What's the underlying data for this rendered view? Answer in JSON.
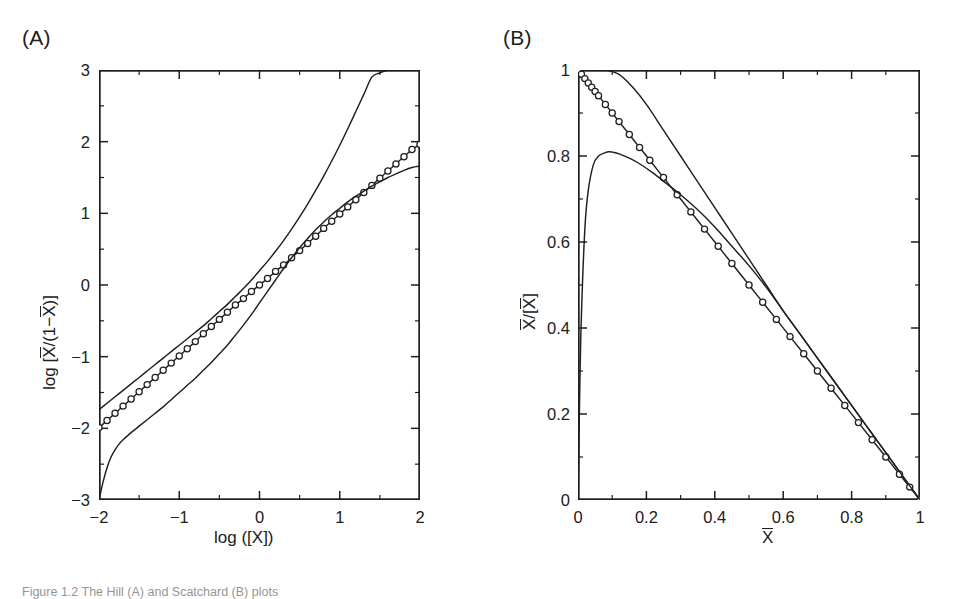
{
  "figure": {
    "caption": "Figure 1.2  The Hill (A) and Scatchard (B) plots",
    "panel_a_label": "(A)",
    "panel_b_label": "(B)"
  },
  "chart_data": [
    {
      "type": "line",
      "panel": "A",
      "title": "(A)",
      "xlabel": "log ([X])",
      "ylabel": "log [X/(1-X)]",
      "ylabel_parts": {
        "prefix": "log [",
        "num": "X",
        "mid": "/(1−",
        "den": "X",
        "suffix": ")]"
      },
      "xlabel_parts": {
        "text": "log ([X])"
      },
      "xlim": [
        -2,
        2
      ],
      "ylim": [
        -3,
        3
      ],
      "xticks": [
        -2,
        -1,
        0,
        1,
        2
      ],
      "xticklabels": [
        "−2",
        "−1",
        "0",
        "1",
        "2"
      ],
      "yticks": [
        -3,
        -2,
        -1,
        0,
        1,
        2,
        3
      ],
      "yticklabels": [
        "−3",
        "−2",
        "−1",
        "0",
        "1",
        "2",
        "3"
      ],
      "minor_ticks_per_interval": 1,
      "grid": false,
      "legend": "none",
      "tick_direction": "in",
      "frame": "box",
      "series": [
        {
          "name": "cooperative-upper-limit",
          "style": "solid",
          "markers": false,
          "x": [
            -2.0,
            -1.9,
            -1.8,
            -1.7,
            -1.6,
            -1.5,
            -1.4,
            -1.3,
            -1.2,
            -1.1,
            -1.0,
            -0.9,
            -0.8,
            -0.7,
            -0.6,
            -0.5,
            -0.4,
            -0.3,
            -0.2,
            -0.1,
            0.0,
            0.1,
            0.2,
            0.3,
            0.4,
            0.5,
            0.6,
            0.7,
            0.8,
            0.9,
            1.0,
            1.1,
            1.2,
            1.3,
            1.4,
            1.5,
            1.6,
            1.7,
            1.8,
            1.9,
            2.0
          ],
          "y": [
            -1.74,
            -1.65,
            -1.56,
            -1.47,
            -1.38,
            -1.29,
            -1.2,
            -1.11,
            -1.02,
            -0.93,
            -0.84,
            -0.75,
            -0.66,
            -0.57,
            -0.47,
            -0.37,
            -0.27,
            -0.16,
            -0.05,
            0.07,
            0.2,
            0.33,
            0.47,
            0.62,
            0.78,
            0.95,
            1.13,
            1.32,
            1.52,
            1.73,
            1.95,
            2.18,
            2.42,
            2.66,
            2.9,
            2.96,
            3.0,
            3.0,
            3.0,
            3.0,
            3.0
          ]
        },
        {
          "name": "binding-data",
          "style": "solid",
          "markers": true,
          "marker_shape": "circle",
          "x": [
            -2.0,
            -1.9,
            -1.8,
            -1.7,
            -1.6,
            -1.5,
            -1.4,
            -1.3,
            -1.2,
            -1.1,
            -1.0,
            -0.9,
            -0.8,
            -0.7,
            -0.6,
            -0.5,
            -0.4,
            -0.3,
            -0.2,
            -0.1,
            0.0,
            0.1,
            0.2,
            0.3,
            0.4,
            0.5,
            0.6,
            0.7,
            0.8,
            0.9,
            1.0,
            1.1,
            1.2,
            1.3,
            1.4,
            1.5,
            1.6,
            1.7,
            1.8,
            1.9,
            2.0
          ],
          "y": [
            -1.99,
            -1.89,
            -1.79,
            -1.69,
            -1.59,
            -1.49,
            -1.39,
            -1.29,
            -1.19,
            -1.09,
            -0.99,
            -0.89,
            -0.79,
            -0.68,
            -0.58,
            -0.48,
            -0.38,
            -0.28,
            -0.19,
            -0.09,
            0.0,
            0.09,
            0.19,
            0.28,
            0.38,
            0.48,
            0.58,
            0.68,
            0.79,
            0.89,
            0.99,
            1.09,
            1.19,
            1.29,
            1.39,
            1.49,
            1.59,
            1.69,
            1.79,
            1.89,
            1.96
          ]
        },
        {
          "name": "non-cooperative-lower-limit",
          "style": "solid",
          "markers": false,
          "x": [
            -2.0,
            -1.95,
            -1.9,
            -1.85,
            -1.8,
            -1.75,
            -1.7,
            -1.6,
            -1.5,
            -1.4,
            -1.3,
            -1.2,
            -1.1,
            -1.0,
            -0.9,
            -0.8,
            -0.7,
            -0.6,
            -0.5,
            -0.4,
            -0.3,
            -0.2,
            -0.1,
            0.0,
            0.1,
            0.2,
            0.3,
            0.4,
            0.5,
            0.6,
            0.7,
            0.8,
            0.9,
            1.0,
            1.1,
            1.2,
            1.3,
            1.4,
            1.5,
            1.6,
            1.7,
            1.8,
            1.9,
            2.0
          ],
          "y": [
            -3.0,
            -2.75,
            -2.55,
            -2.4,
            -2.3,
            -2.22,
            -2.16,
            -2.06,
            -1.97,
            -1.88,
            -1.79,
            -1.7,
            -1.6,
            -1.5,
            -1.4,
            -1.3,
            -1.19,
            -1.08,
            -0.96,
            -0.84,
            -0.7,
            -0.56,
            -0.41,
            -0.25,
            -0.09,
            0.07,
            0.23,
            0.38,
            0.52,
            0.65,
            0.77,
            0.88,
            0.98,
            1.07,
            1.16,
            1.24,
            1.31,
            1.38,
            1.44,
            1.5,
            1.55,
            1.6,
            1.64,
            1.66
          ]
        }
      ]
    },
    {
      "type": "line",
      "panel": "B",
      "title": "(B)",
      "xlabel": "X",
      "ylabel": "X/[X]",
      "ylabel_parts": {
        "num": "X",
        "mid": "/[",
        "den": "X",
        "suffix": "]"
      },
      "xlim": [
        0,
        1
      ],
      "ylim": [
        0,
        1
      ],
      "xticks": [
        0,
        0.2,
        0.4,
        0.6,
        0.8,
        1
      ],
      "xticklabels": [
        "0",
        "0.2",
        "0.4",
        "0.6",
        "0.8",
        "1"
      ],
      "yticks": [
        0,
        0.2,
        0.4,
        0.6,
        0.8,
        1
      ],
      "yticklabels": [
        "0",
        "0.2",
        "0.4",
        "0.6",
        "0.8",
        "1"
      ],
      "minor_ticks_per_interval": 1,
      "grid": false,
      "legend": "none",
      "tick_direction": "in",
      "frame": "box",
      "series": [
        {
          "name": "cooperative-upper-curve",
          "style": "solid",
          "markers": false,
          "x": [
            0.0,
            0.02,
            0.05,
            0.08,
            0.12,
            0.16,
            0.2,
            0.25,
            0.3,
            0.35,
            0.4,
            0.45,
            0.5,
            0.55,
            0.6,
            0.65,
            0.7,
            0.75,
            0.8,
            0.85,
            0.9,
            0.95,
            1.0
          ],
          "y": [
            1.0,
            1.0,
            1.0,
            1.0,
            0.99,
            0.96,
            0.92,
            0.86,
            0.8,
            0.74,
            0.68,
            0.62,
            0.56,
            0.5,
            0.44,
            0.385,
            0.33,
            0.275,
            0.22,
            0.165,
            0.11,
            0.055,
            0.0
          ]
        },
        {
          "name": "binding-data",
          "style": "solid",
          "markers": true,
          "marker_shape": "circle",
          "x": [
            0.0,
            0.01,
            0.02,
            0.03,
            0.04,
            0.05,
            0.06,
            0.08,
            0.1,
            0.12,
            0.15,
            0.18,
            0.21,
            0.25,
            0.29,
            0.33,
            0.37,
            0.41,
            0.45,
            0.5,
            0.54,
            0.58,
            0.62,
            0.66,
            0.7,
            0.74,
            0.78,
            0.82,
            0.86,
            0.9,
            0.94,
            0.97,
            1.0
          ],
          "y": [
            1.0,
            0.99,
            0.98,
            0.97,
            0.96,
            0.95,
            0.94,
            0.92,
            0.9,
            0.88,
            0.85,
            0.82,
            0.79,
            0.75,
            0.71,
            0.67,
            0.63,
            0.59,
            0.55,
            0.5,
            0.46,
            0.42,
            0.38,
            0.34,
            0.3,
            0.26,
            0.22,
            0.18,
            0.14,
            0.1,
            0.06,
            0.03,
            0.0
          ]
        },
        {
          "name": "non-cooperative-peaked-curve",
          "style": "solid",
          "markers": false,
          "x": [
            0.0,
            0.005,
            0.01,
            0.02,
            0.03,
            0.045,
            0.06,
            0.08,
            0.09,
            0.1,
            0.12,
            0.15,
            0.18,
            0.22,
            0.26,
            0.3,
            0.35,
            0.4,
            0.45,
            0.5,
            0.55,
            0.6,
            0.65,
            0.7,
            0.75,
            0.8,
            0.85,
            0.9,
            0.95,
            1.0
          ],
          "y": [
            0.0,
            0.25,
            0.43,
            0.63,
            0.72,
            0.78,
            0.8,
            0.808,
            0.81,
            0.809,
            0.805,
            0.795,
            0.782,
            0.76,
            0.735,
            0.71,
            0.675,
            0.635,
            0.59,
            0.545,
            0.495,
            0.44,
            0.385,
            0.33,
            0.275,
            0.22,
            0.165,
            0.11,
            0.055,
            0.0
          ]
        }
      ],
      "annotations": {
        "peak_value": 0.81,
        "peak_x": 0.09
      }
    }
  ]
}
